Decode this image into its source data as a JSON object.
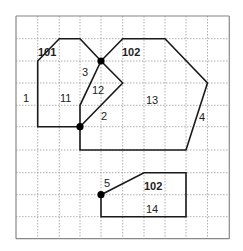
{
  "diagram": {
    "grid": {
      "cols": 10,
      "rows": 10,
      "x_lines": [
        16,
        37.7,
        59.3,
        80,
        101,
        122.7,
        144,
        165,
        186,
        207.5,
        229.3
      ],
      "y_lines": [
        16,
        38.7,
        61,
        83,
        105.3,
        126.7,
        150,
        172.7,
        194.7,
        216.7,
        238.7
      ],
      "border_color": "#888888",
      "line_color": "#9a9a9a"
    },
    "colors": {
      "stroke": "#1a1a1a",
      "node": "#000000",
      "text": "#222222"
    },
    "polylines": [
      {
        "name": "outline-region-101",
        "points": [
          [
            3,
            5
          ],
          [
            1,
            5
          ],
          [
            1,
            2
          ],
          [
            2,
            1
          ],
          [
            3,
            1
          ],
          [
            4,
            2
          ]
        ]
      },
      {
        "name": "edge-3",
        "points": [
          [
            4,
            2
          ],
          [
            3,
            4
          ],
          [
            3,
            5
          ]
        ]
      },
      {
        "name": "edge-12-triangle",
        "points": [
          [
            4,
            2
          ],
          [
            5,
            3
          ],
          [
            3,
            5
          ]
        ]
      },
      {
        "name": "outline-region-102",
        "points": [
          [
            4,
            2
          ],
          [
            5,
            1
          ],
          [
            7,
            1
          ],
          [
            9,
            3
          ],
          [
            8,
            6
          ],
          [
            3,
            6
          ],
          [
            3,
            5
          ]
        ]
      },
      {
        "name": "outline-region-102-lower",
        "points": [
          [
            4,
            8
          ],
          [
            6,
            7
          ],
          [
            8,
            7
          ],
          [
            8,
            9
          ],
          [
            4,
            9
          ],
          [
            4,
            8
          ]
        ]
      }
    ],
    "nodes": [
      {
        "name": "node-top",
        "at": [
          4,
          2
        ]
      },
      {
        "name": "node-middle",
        "at": [
          3,
          5
        ]
      },
      {
        "name": "node-bottom",
        "at": [
          4,
          8
        ]
      }
    ],
    "labels": [
      {
        "name": "label-101",
        "text": "101",
        "x": 38,
        "y": 56,
        "bold": true
      },
      {
        "name": "label-102-top",
        "text": "102",
        "x": 122,
        "y": 56,
        "bold": true
      },
      {
        "name": "label-102-bottom",
        "text": "102",
        "x": 144,
        "y": 190,
        "bold": true
      },
      {
        "name": "label-1",
        "text": "1",
        "x": 23,
        "y": 102,
        "bold": false
      },
      {
        "name": "label-11",
        "text": "11",
        "x": 60,
        "y": 102,
        "bold": false
      },
      {
        "name": "label-3",
        "text": "3",
        "x": 82,
        "y": 76,
        "bold": false
      },
      {
        "name": "label-12",
        "text": "12",
        "x": 92,
        "y": 94,
        "bold": false
      },
      {
        "name": "label-2",
        "text": "2",
        "x": 101,
        "y": 120,
        "bold": false
      },
      {
        "name": "label-13",
        "text": "13",
        "x": 146,
        "y": 104,
        "bold": false
      },
      {
        "name": "label-4",
        "text": "4",
        "x": 199,
        "y": 121,
        "bold": false
      },
      {
        "name": "label-5",
        "text": "5",
        "x": 104,
        "y": 187,
        "bold": false
      },
      {
        "name": "label-14",
        "text": "14",
        "x": 146,
        "y": 213,
        "bold": false
      }
    ]
  }
}
